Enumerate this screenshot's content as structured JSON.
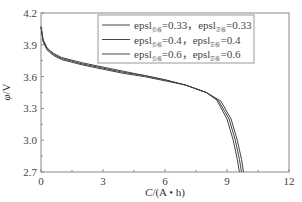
{
  "chart_data": {
    "type": "line",
    "title": "",
    "xlabel": "C/(A • h)",
    "ylabel": "φ/V",
    "xlim": [
      0,
      12
    ],
    "ylim": [
      2.7,
      4.2
    ],
    "x_ticks": [
      "0",
      "3",
      "6",
      "9",
      "12"
    ],
    "y_ticks": [
      "2.7",
      "3.0",
      "3.3",
      "3.6",
      "3.9",
      "4.2"
    ],
    "grid": false,
    "legend_position": "upper right (inside)",
    "series": [
      {
        "name": "epsl负极=0.33，epsl正极=0.33",
        "legend": {
          "prefix": "epsl",
          "sub1": "负极",
          "val1": "=0.33，",
          "mid": "epsl",
          "sub2": "正极",
          "val2": "=0.33"
        },
        "x": [
          0,
          0.1,
          0.3,
          0.6,
          1.0,
          2.0,
          3.0,
          4.0,
          5.0,
          6.0,
          7.0,
          8.0,
          8.5,
          9.0,
          9.3,
          9.5,
          9.6
        ],
        "y": [
          4.07,
          3.95,
          3.87,
          3.82,
          3.78,
          3.73,
          3.69,
          3.65,
          3.61,
          3.57,
          3.52,
          3.45,
          3.38,
          3.2,
          3.0,
          2.82,
          2.7
        ]
      },
      {
        "name": "epsl负极=0.4，epsl正极=0.4",
        "legend": {
          "prefix": "epsl",
          "sub1": "负极",
          "val1": "=0.4，",
          "mid": "epsl",
          "sub2": "正极",
          "val2": "=0.4"
        },
        "x": [
          0,
          0.1,
          0.3,
          0.6,
          1.0,
          2.0,
          3.0,
          4.0,
          5.0,
          6.0,
          7.0,
          8.0,
          8.6,
          9.1,
          9.4,
          9.6,
          9.7
        ],
        "y": [
          4.07,
          3.94,
          3.86,
          3.81,
          3.77,
          3.72,
          3.68,
          3.64,
          3.61,
          3.57,
          3.52,
          3.45,
          3.37,
          3.2,
          3.0,
          2.82,
          2.7
        ]
      },
      {
        "name": "epsl负极=0.6，epsl正极=0.6",
        "legend": {
          "prefix": "epsl",
          "sub1": "负极",
          "val1": "=0.6，",
          "mid": "epsl",
          "sub2": "正极",
          "val2": "=0.6"
        },
        "x": [
          0,
          0.1,
          0.3,
          0.6,
          1.0,
          2.0,
          3.0,
          4.0,
          5.0,
          6.0,
          7.0,
          8.0,
          8.7,
          9.2,
          9.5,
          9.7,
          9.8
        ],
        "y": [
          4.07,
          3.93,
          3.85,
          3.8,
          3.76,
          3.71,
          3.67,
          3.63,
          3.6,
          3.56,
          3.52,
          3.45,
          3.37,
          3.2,
          3.0,
          2.82,
          2.7
        ]
      }
    ]
  },
  "colors": {
    "axis": "#888888",
    "line": "#444444",
    "legend_border": "#999999"
  }
}
